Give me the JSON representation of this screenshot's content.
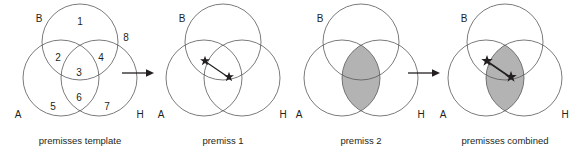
{
  "figure": {
    "type": "venn-diagram-sequence",
    "width": 586,
    "height": 151,
    "colors": {
      "circle_stroke": "#58595b",
      "shade_fill": "#b3b3b3",
      "text": "#231f20",
      "background": "#ffffff",
      "arrow": "#231f20"
    },
    "circle_radius": 38,
    "panels": [
      {
        "id": "premisses-template",
        "caption": "premisses template",
        "caption_xy": [
          80,
          144
        ],
        "origin_x": 0,
        "set_labels": [
          {
            "name": "B",
            "text": "B",
            "x": 39,
            "y": 22
          },
          {
            "name": "A",
            "text": "A",
            "x": 18,
            "y": 118
          },
          {
            "name": "H",
            "text": "H",
            "x": 140,
            "y": 118
          }
        ],
        "region_numbers": [
          {
            "id": "1",
            "text": "1",
            "x": 80,
            "y": 25,
            "region": "B-only"
          },
          {
            "id": "2",
            "text": "2",
            "x": 58,
            "y": 61,
            "region": "A-and-B"
          },
          {
            "id": "3",
            "text": "3",
            "x": 79,
            "y": 76,
            "region": "A-and-B-and-H"
          },
          {
            "id": "4",
            "text": "4",
            "x": 101,
            "y": 61,
            "region": "B-and-H"
          },
          {
            "id": "5",
            "text": "5",
            "x": 53,
            "y": 110,
            "region": "A-only"
          },
          {
            "id": "6",
            "text": "6",
            "x": 79,
            "y": 101,
            "region": "A-and-H"
          },
          {
            "id": "7",
            "text": "7",
            "x": 107,
            "y": 110,
            "region": "H-only"
          },
          {
            "id": "8",
            "text": "8",
            "x": 126,
            "y": 41,
            "region": "outside-all"
          }
        ],
        "shaded_region": false,
        "stars": []
      },
      {
        "id": "premiss-1",
        "caption": "premiss 1",
        "caption_xy": [
          222,
          144
        ],
        "origin_x": 143,
        "set_labels": [
          {
            "name": "B",
            "text": "B",
            "x": 39,
            "y": 22
          },
          {
            "name": "A",
            "text": "A",
            "x": 18,
            "y": 118
          },
          {
            "name": "H",
            "text": "H",
            "x": 140,
            "y": 118
          }
        ],
        "region_numbers": [],
        "shaded_region": false,
        "stars": [
          {
            "x": 62,
            "y": 61
          },
          {
            "x": 85,
            "y": 76
          }
        ],
        "star_link": [
          [
            62,
            61
          ],
          [
            85,
            76
          ]
        ],
        "star_weight": "light"
      },
      {
        "id": "premiss-2",
        "caption": "premiss 2",
        "caption_xy": [
          364,
          144
        ],
        "origin_x": 285,
        "set_labels": [
          {
            "name": "B",
            "text": "B",
            "x": 39,
            "y": 22
          },
          {
            "name": "A",
            "text": "A",
            "x": 18,
            "y": 118
          },
          {
            "name": "H",
            "text": "H",
            "x": 140,
            "y": 118
          }
        ],
        "region_numbers": [],
        "shaded_region": true,
        "shaded_region_name": "A-intersect-H",
        "stars": []
      },
      {
        "id": "premisses-combined",
        "caption": "premisses combined",
        "caption_xy": [
          508,
          144
        ],
        "origin_x": 429,
        "set_labels": [
          {
            "name": "B",
            "text": "B",
            "x": 39,
            "y": 22
          },
          {
            "name": "A",
            "text": "A",
            "x": 18,
            "y": 118
          },
          {
            "name": "H",
            "text": "H",
            "x": 140,
            "y": 118
          }
        ],
        "region_numbers": [],
        "shaded_region": true,
        "shaded_region_name": "A-intersect-H",
        "stars": [
          {
            "x": 62,
            "y": 61
          },
          {
            "x": 85,
            "y": 76
          }
        ],
        "star_link": [
          [
            62,
            61
          ],
          [
            85,
            76
          ]
        ],
        "star_weight": "bold"
      }
    ],
    "arrows": [
      {
        "name": "arrow-template-to-premiss1",
        "x1": 122,
        "y1": 73,
        "x2": 150,
        "y2": 73
      },
      {
        "name": "arrow-premiss2-to-combined",
        "x1": 408,
        "y1": 73,
        "x2": 436,
        "y2": 73
      }
    ]
  }
}
